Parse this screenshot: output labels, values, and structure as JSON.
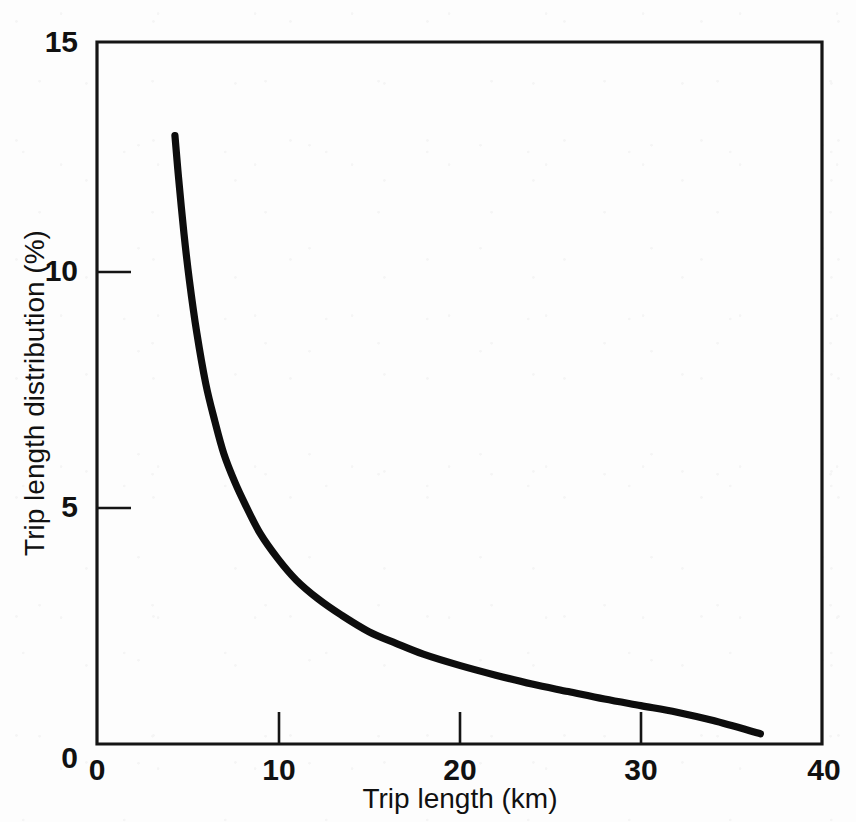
{
  "chart_data": {
    "type": "line",
    "title": "",
    "xlabel": "Trip length (km)",
    "ylabel": "Trip length distribution (%)",
    "xlim": [
      0,
      40
    ],
    "ylim": [
      0,
      15
    ],
    "xticks": [
      0,
      10,
      20,
      30,
      40
    ],
    "yticks": [
      0,
      5,
      10,
      15
    ],
    "xtick_labels": [
      "0",
      "10",
      "20",
      "30",
      "40"
    ],
    "ytick_labels": [
      "0",
      "5",
      "10",
      "15"
    ],
    "grid": false,
    "legend": null,
    "legend_position": "none",
    "tick_direction": "in",
    "frame": "full-box",
    "series": [
      {
        "name": "Trip length distribution",
        "color": "#0d0d0d",
        "line_width": 7.2,
        "x": [
          4.3,
          4.5,
          4.8,
          5.1,
          5.5,
          6.0,
          6.5,
          7.0,
          7.6,
          8.2,
          9.0,
          10.0,
          11.0,
          12.2,
          13.5,
          15.0,
          16.5,
          18.0,
          20.0,
          22.0,
          24.0,
          26.0,
          28.0,
          30.0,
          32.0,
          34.0,
          36.6
        ],
        "y": [
          13.0,
          12.1,
          10.9,
          9.9,
          8.8,
          7.7,
          6.9,
          6.2,
          5.6,
          5.1,
          4.5,
          3.95,
          3.5,
          3.1,
          2.75,
          2.4,
          2.15,
          1.92,
          1.68,
          1.47,
          1.28,
          1.12,
          0.96,
          0.82,
          0.68,
          0.5,
          0.22
        ]
      }
    ],
    "annotations": []
  },
  "axes": {
    "y_title": "Trip length distribution (%)",
    "x_title": "Trip length (km)",
    "y_tick_labels": [
      "15",
      "10",
      "5",
      "0"
    ],
    "x_tick_labels": [
      "0",
      "10",
      "20",
      "30",
      "40"
    ]
  },
  "colors": {
    "curve": "#0d0d0d",
    "frame": "#151515",
    "text": "#111111",
    "background": "#fdfdfd"
  }
}
